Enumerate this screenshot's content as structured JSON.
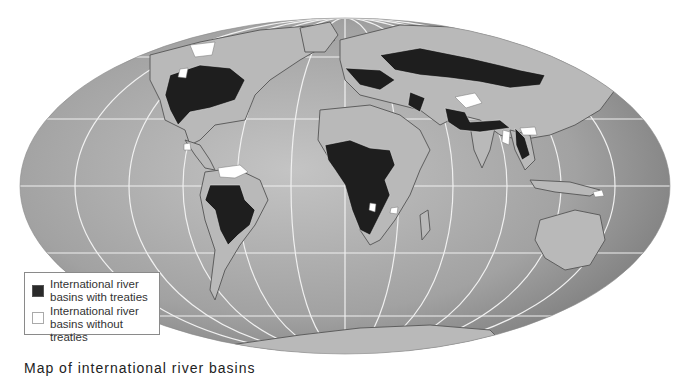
{
  "map": {
    "projection": "Mollweide-like world map",
    "colors": {
      "ocean_light": "#b4b4b4",
      "ocean_dark": "#7e7e7e",
      "land": "#b8b8b8",
      "land_border": "#6a6a6a",
      "basin_with_treaty": "#1e1e1e",
      "basin_without_treaty": "#ffffff",
      "graticule": "#f2f2f2"
    }
  },
  "legend": {
    "items": [
      {
        "label_line1": "International river",
        "label_line2": "basins with treaties",
        "swatch": "dark"
      },
      {
        "label_line1": "International river",
        "label_line2": "basins without treaties",
        "swatch": "light"
      }
    ]
  },
  "caption": "Map of international river basins"
}
